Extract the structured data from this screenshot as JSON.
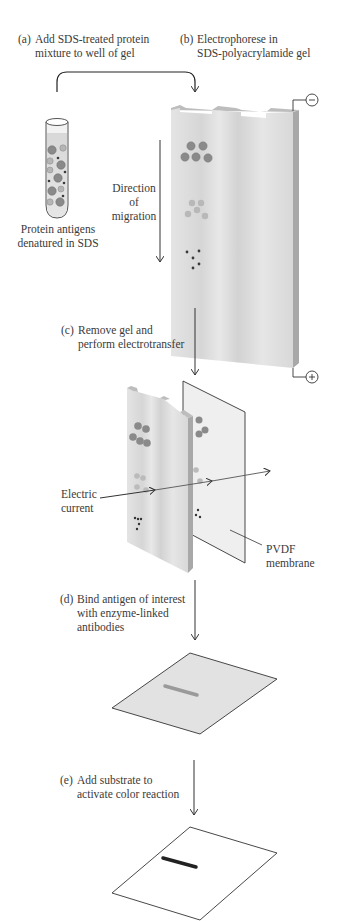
{
  "figure": {
    "steps": [
      {
        "letter": "(a)",
        "lines": [
          "Add SDS-treated protein",
          "mixture to well of gel"
        ]
      },
      {
        "letter": "(b)",
        "lines": [
          "Electrophorese in",
          "SDS-polyacrylamide gel"
        ]
      },
      {
        "letter": "(c)",
        "lines": [
          "Remove gel and",
          "perform electrotransfer"
        ]
      },
      {
        "letter": "(d)",
        "lines": [
          "Bind antigen of interest",
          "with enzyme-linked",
          "antibodies"
        ]
      },
      {
        "letter": "(e)",
        "lines": [
          "Add substrate to",
          "activate color reaction"
        ]
      }
    ],
    "labels": {
      "tube": [
        "Protein antigens",
        "denatured in SDS"
      ],
      "direction": [
        "Direction",
        "of",
        "migration"
      ],
      "electric": [
        "Electric",
        "current"
      ],
      "membrane": [
        "PVDF",
        "membrane"
      ]
    },
    "electrodes": {
      "negative": "−",
      "positive": "+"
    },
    "colors": {
      "gel_face": "#dcdcdc",
      "gel_side": "#a8a8a8",
      "gel_top": "#b8b8b8",
      "large_protein": "#8a8a8a",
      "medium_protein": "#b5b5b5",
      "small_protein": "#3a3a3a",
      "membrane_d": "#e2e2e2",
      "band_d": "#9a9a9a",
      "band_e": "#222222",
      "line": "#333333"
    }
  }
}
